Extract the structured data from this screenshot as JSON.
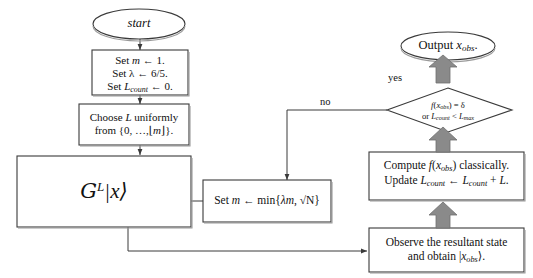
{
  "diagram": {
    "colors": {
      "stroke": "#3a3a3a",
      "block_arrow_fill": "#8a8a8a",
      "block_arrow_stroke": "#6f6f6f",
      "text": "#111111",
      "background": "#ffffff"
    },
    "nodes": {
      "start": {
        "shape": "ellipse",
        "label": "start"
      },
      "initialize": {
        "shape": "process",
        "line1_prefix": "Set ",
        "line1_var": "m",
        "line1_suffix": " ← 1.",
        "line2_prefix": "Set ",
        "line2_var": "λ",
        "line2_suffix": " ← 6/5.",
        "line3_prefix": "Set ",
        "line3_var": "L",
        "line3_sub": "count",
        "line3_suffix": " ← 0."
      },
      "choose_l": {
        "shape": "process",
        "line1_prefix": "Choose ",
        "line1_var": "L",
        "line1_suffix": " uniformly",
        "line2_prefix": "from {0, …,⌊",
        "line2_var": "m",
        "line2_suffix": "⌋}."
      },
      "grover": {
        "shape": "process",
        "operator": "G",
        "exponent": "L",
        "ket": "|x⟩"
      },
      "set_m": {
        "shape": "process",
        "prefix": "Set ",
        "var": "m",
        "body": " ← min{",
        "lambda": "λ",
        "var2": "m",
        "tail": ", √N}"
      },
      "compute": {
        "shape": "process",
        "line1_a": "Compute ",
        "line1_f": "f",
        "line1_b": "(",
        "line1_x": "x",
        "line1_xsub": "obs",
        "line1_c": ") classically.",
        "line2_a": "Update ",
        "line2_l1": "L",
        "line2_l1sub": "count",
        "line2_b": " ← ",
        "line2_l2": "L",
        "line2_l2sub": "count",
        "line2_c": " + ",
        "line2_l3": "L",
        "line2_d": "."
      },
      "observe": {
        "shape": "process",
        "line1": "Observe the resultant state",
        "line2_a": "and obtain |",
        "line2_x": "x",
        "line2_xsub": "obs",
        "line2_b": "⟩."
      },
      "condition": {
        "shape": "decision",
        "line1_f": "f",
        "line1_a": "(",
        "line1_x": "x",
        "line1_xsub": "obs",
        "line1_b": ") = ",
        "line1_delta": "δ",
        "line2_a": "or ",
        "line2_l1": "L",
        "line2_l1sub": "count",
        "line2_b": " < ",
        "line2_l2": "L",
        "line2_l2sub": "max"
      },
      "output": {
        "shape": "ellipse",
        "prefix": "Output ",
        "var": "x",
        "sub": "obs",
        "suffix": "."
      }
    },
    "edge_labels": {
      "yes": "yes",
      "no": "no"
    }
  }
}
